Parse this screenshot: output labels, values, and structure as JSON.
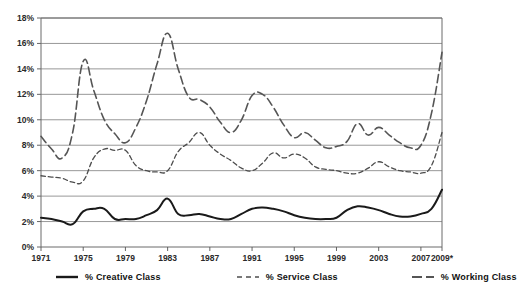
{
  "chart_data": {
    "type": "line",
    "title": "",
    "xlabel": "",
    "ylabel": "",
    "grid": true,
    "legend_position": "bottom",
    "ylim": [
      0,
      18
    ],
    "xlim": [
      1971,
      2009
    ],
    "y_ticks": [
      "0%",
      "2%",
      "4%",
      "6%",
      "8%",
      "10%",
      "12%",
      "14%",
      "16%",
      "18%"
    ],
    "y_tick_values": [
      0,
      2,
      4,
      6,
      8,
      10,
      12,
      14,
      16,
      18
    ],
    "x_ticks": [
      "1971",
      "1975",
      "1979",
      "1983",
      "1987",
      "1991",
      "1995",
      "1999",
      "2003",
      "2007",
      "2009*"
    ],
    "x_tick_values": [
      1971,
      1975,
      1979,
      1983,
      1987,
      1991,
      1995,
      1999,
      2003,
      2007,
      2009
    ],
    "x": [
      1971,
      1972,
      1973,
      1974,
      1975,
      1976,
      1977,
      1978,
      1979,
      1980,
      1981,
      1982,
      1983,
      1984,
      1985,
      1986,
      1987,
      1988,
      1989,
      1990,
      1991,
      1992,
      1993,
      1994,
      1995,
      1996,
      1997,
      1998,
      1999,
      2000,
      2001,
      2002,
      2003,
      2004,
      2005,
      2006,
      2007,
      2008,
      2009
    ],
    "series": [
      {
        "name": "% Creative Class",
        "style": "solid",
        "color": "#1a1a1a",
        "width": 2.0,
        "values": [
          2.3,
          2.2,
          2.0,
          1.8,
          2.8,
          3.0,
          3.0,
          2.2,
          2.2,
          2.2,
          2.5,
          2.9,
          3.8,
          2.6,
          2.5,
          2.6,
          2.4,
          2.2,
          2.2,
          2.6,
          3.0,
          3.1,
          3.0,
          2.8,
          2.5,
          2.3,
          2.2,
          2.2,
          2.3,
          2.9,
          3.2,
          3.1,
          2.9,
          2.6,
          2.4,
          2.4,
          2.6,
          3.0,
          4.5
        ]
      },
      {
        "name": "% Service Class",
        "style": "dashed-short",
        "color": "#4d4d4d",
        "width": 1.3,
        "values": [
          5.6,
          5.5,
          5.4,
          5.1,
          5.2,
          7.0,
          7.7,
          7.6,
          7.6,
          6.4,
          6.0,
          5.9,
          6.0,
          7.5,
          8.2,
          9.0,
          8.0,
          7.3,
          6.8,
          6.2,
          6.0,
          6.6,
          7.4,
          7.0,
          7.3,
          7.0,
          6.3,
          6.1,
          6.0,
          5.8,
          5.8,
          6.2,
          6.7,
          6.3,
          6.0,
          5.9,
          5.8,
          6.4,
          9.0
        ]
      },
      {
        "name": "% Working Class",
        "style": "dashed-long",
        "color": "#555555",
        "width": 1.6,
        "values": [
          8.7,
          7.7,
          7.0,
          9.0,
          14.6,
          12.3,
          10.0,
          8.9,
          8.2,
          9.4,
          11.5,
          14.4,
          16.8,
          14.0,
          11.8,
          11.6,
          11.0,
          9.8,
          9.0,
          10.0,
          11.9,
          12.0,
          11.0,
          9.6,
          8.6,
          9.0,
          8.4,
          7.8,
          7.9,
          8.3,
          9.7,
          8.8,
          9.4,
          8.8,
          8.2,
          7.8,
          8.0,
          10.5,
          15.3
        ]
      }
    ]
  },
  "legend": {
    "items": [
      {
        "label": "% Creative Class",
        "style": "solid"
      },
      {
        "label": "% Service Class",
        "style": "dashed-short"
      },
      {
        "label": "% Working Class",
        "style": "dashed-long"
      }
    ]
  }
}
